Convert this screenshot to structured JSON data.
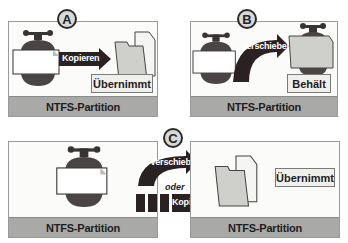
{
  "panels": {
    "a": {
      "badge": "A",
      "arrow_label": "Kopieren",
      "result_label": "Übernimmt",
      "partition_label": "NTFS-Partition"
    },
    "b": {
      "badge": "B",
      "arrow_label": "Verschieben",
      "result_label": "Behält",
      "partition_label": "NTFS-Partition"
    },
    "c": {
      "badge": "C",
      "arrow_top_label": "Verschieben",
      "connector": "oder",
      "arrow_bottom_label": "Kopieren",
      "result_label": "Übernimmt",
      "left_partition_label": "NTFS-Partition",
      "right_partition_label": "NTFS-Partition"
    }
  },
  "colors": {
    "arrow": "#2a2222",
    "partition_bar": "#a9a9a7",
    "folder": "#cfcfcc",
    "clamp": "#4a4444"
  }
}
